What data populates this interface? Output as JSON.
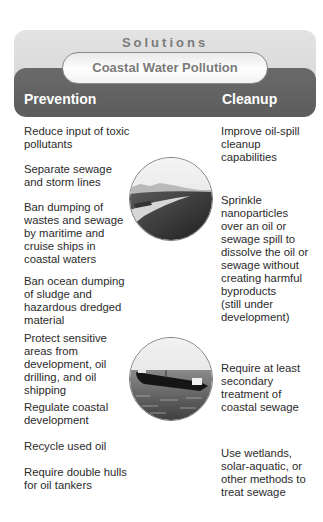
{
  "header": {
    "title": "Solutions",
    "subtitle": "Coastal Water Pollution",
    "left_heading": "Prevention",
    "right_heading": "Cleanup"
  },
  "prevention": {
    "items": [
      "Reduce input of toxic\npollutants",
      "Separate sewage\nand storm lines",
      "Ban dumping of\nwastes and sewage\nby maritime and\ncruise ships in\ncoastal waters",
      "Ban ocean dumping\nof sludge and\nhazardous dredged\nmaterial",
      "Protect sensitive\nareas from\ndevelopment, oil\ndrilling, and oil\nshipping",
      "Regulate coastal\ndevelopment",
      "Recycle used oil",
      "Require double hulls\nfor oil tankers"
    ]
  },
  "cleanup": {
    "items": [
      "Improve oil-spill\ncleanup\ncapabilities",
      "Sprinkle\nnanoparticles\nover an oil or\nsewage spill to\ndissolve the oil or\nsewage without\ncreating harmful\nbyproducts\n(still under\ndevelopment)",
      "Require at least\nsecondary\ntreatment of\ncoastal sewage",
      "Use wetlands,\nsolar-aquatic, or\nother methods to\ntreat sewage"
    ]
  },
  "images": {
    "top": "coastline-photo",
    "bottom": "oil-tanker-photo"
  }
}
